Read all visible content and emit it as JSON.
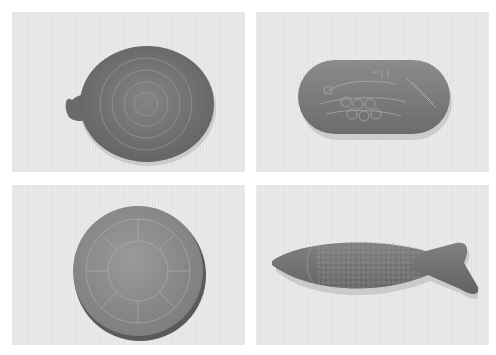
{
  "figure": {
    "layout": "2x2 photo grid",
    "panels": [
      {
        "id": "p1",
        "subject": "round clay disc with small handle, concentric incised circle pattern"
      },
      {
        "id": "p2",
        "subject": "oval clay tablet with incised fish-scale and bird motif"
      },
      {
        "id": "p3",
        "subject": "circular clay disc with radiating sun / star incised pattern"
      },
      {
        "id": "p4",
        "subject": "fish-shaped clay plaque covered with scale pattern"
      }
    ],
    "caption": "",
    "colors": {
      "background": "#ffffff",
      "panel_bg": "#e6e6e6",
      "object_dark": "#6f6f6f",
      "object_mid": "#8a8a8a",
      "incised_line": "#a9a9a9"
    }
  }
}
